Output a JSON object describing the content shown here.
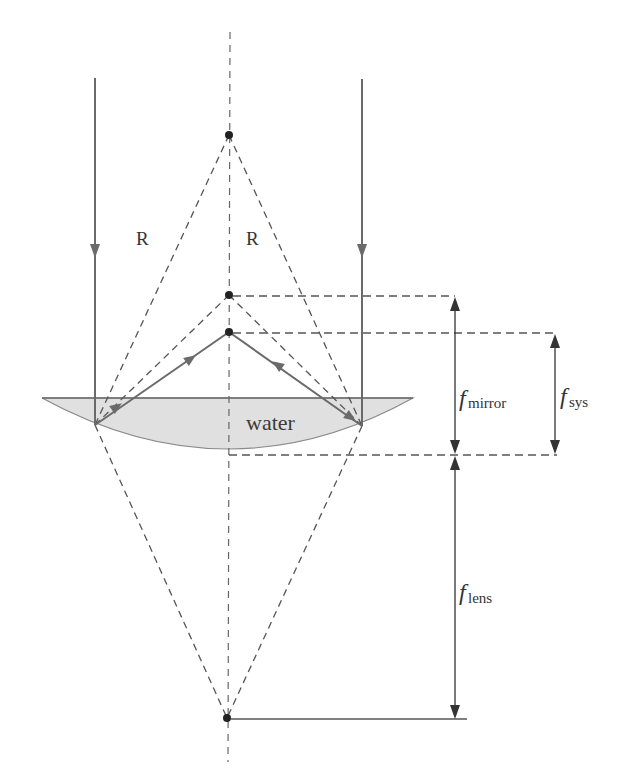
{
  "diagram": {
    "title": "",
    "colors": {
      "ray": "#6a6a6a",
      "dashed": "#555555",
      "water_fill": "#e0e0e0",
      "water_edge": "#8a8a8a",
      "dot": "#222222",
      "dimension": "#333333"
    },
    "labels": {
      "radius_left": "R",
      "radius_right": "R",
      "medium": "water",
      "f_mirror_main": "f",
      "f_mirror_sub": "mirror",
      "f_sys_main": "f",
      "f_sys_sub": "sys",
      "f_lens_main": "f",
      "f_lens_sub": "lens"
    },
    "points": {
      "center_of_curvature": [
        229,
        135
      ],
      "mirror_focus": [
        229,
        295
      ],
      "system_focus": [
        229,
        332
      ],
      "lens_focus": [
        227,
        718
      ]
    }
  }
}
